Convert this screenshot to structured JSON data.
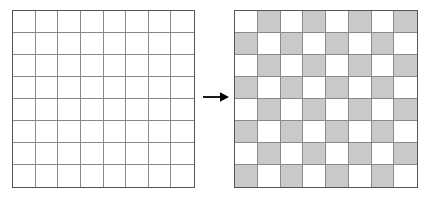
{
  "figure": {
    "name": "checkerboard-transformation-diagram",
    "background_color": "#ffffff"
  },
  "arrow": {
    "name": "rightward-arrow",
    "direction": "right",
    "label": "",
    "color": "#000000"
  },
  "grids": [
    {
      "id": "grid-plain",
      "title": "",
      "rows": 8,
      "columns": 8,
      "border_color": "#555555",
      "line_color": "#8a8a8a",
      "fill_color": "#ffffff",
      "cells": [
        [
          0,
          0,
          0,
          0,
          0,
          0,
          0,
          0
        ],
        [
          0,
          0,
          0,
          0,
          0,
          0,
          0,
          0
        ],
        [
          0,
          0,
          0,
          0,
          0,
          0,
          0,
          0
        ],
        [
          0,
          0,
          0,
          0,
          0,
          0,
          0,
          0
        ],
        [
          0,
          0,
          0,
          0,
          0,
          0,
          0,
          0
        ],
        [
          0,
          0,
          0,
          0,
          0,
          0,
          0,
          0
        ],
        [
          0,
          0,
          0,
          0,
          0,
          0,
          0,
          0
        ],
        [
          0,
          0,
          0,
          0,
          0,
          0,
          0,
          0
        ]
      ]
    },
    {
      "id": "grid-checker",
      "title": "",
      "rows": 8,
      "columns": 8,
      "border_color": "#555555",
      "line_color": "#8a8a8a",
      "fill_color": "#c9c9c9",
      "cells": [
        [
          0,
          1,
          0,
          1,
          0,
          1,
          0,
          1
        ],
        [
          1,
          0,
          1,
          0,
          1,
          0,
          1,
          0
        ],
        [
          0,
          1,
          0,
          1,
          0,
          1,
          0,
          1
        ],
        [
          1,
          0,
          1,
          0,
          1,
          0,
          1,
          0
        ],
        [
          0,
          1,
          0,
          1,
          0,
          1,
          0,
          1
        ],
        [
          1,
          0,
          1,
          0,
          1,
          0,
          1,
          0
        ],
        [
          0,
          1,
          0,
          1,
          0,
          1,
          0,
          1
        ],
        [
          1,
          0,
          1,
          0,
          1,
          0,
          1,
          0
        ]
      ]
    }
  ]
}
